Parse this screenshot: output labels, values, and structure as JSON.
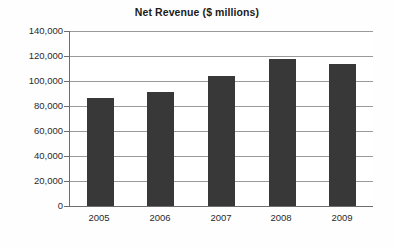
{
  "chart_data": {
    "type": "bar",
    "title": "Net Revenue ($ millions)",
    "xlabel": "",
    "ylabel": "",
    "categories": [
      "2005",
      "2006",
      "2007",
      "2008",
      "2009"
    ],
    "values": [
      86000,
      91000,
      104000,
      117500,
      113500
    ],
    "series": [
      {
        "name": "Net Revenue",
        "values": [
          86000,
          91000,
          104000,
          117500,
          113500
        ]
      }
    ],
    "ylim": [
      0,
      140000
    ],
    "ytick_values": [
      140000,
      120000,
      100000,
      80000,
      60000,
      40000,
      20000,
      0
    ],
    "ytick_labels": [
      "140,000",
      "120,000",
      "100,000",
      "80,000",
      "60,000",
      "40,000",
      "20,000",
      "0"
    ],
    "grid": true,
    "legend": false,
    "legend_position": "none",
    "bar_color": "#383838",
    "gridline_color": "#9a9a9a",
    "axis_color": "#6d6d6d",
    "background_color": "#ffffff"
  }
}
